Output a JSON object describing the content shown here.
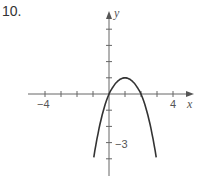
{
  "problem": {
    "number": "10."
  },
  "chart_data": {
    "type": "line",
    "title": "",
    "xlabel": "x",
    "ylabel": "y",
    "xlim": [
      -4.5,
      5.2
    ],
    "ylim": [
      -5,
      5
    ],
    "x_tick_labels": [
      {
        "value": -4,
        "label": "−4"
      },
      {
        "value": 4,
        "label": "4"
      }
    ],
    "y_tick_labels": [
      {
        "value": -3,
        "label": "−3"
      }
    ],
    "x_ticks": [
      -4,
      -3,
      -2,
      -1,
      1,
      2,
      3,
      4
    ],
    "y_ticks": [
      -4,
      -3,
      -2,
      -1,
      1,
      2,
      3,
      4
    ],
    "grid": false,
    "series": [
      {
        "name": "parabola",
        "description": "downward-opening parabola, vertex (1, 1), x-intercepts 0 and 2",
        "x": [
          -0.95,
          -0.5,
          0,
          0.5,
          1,
          1.5,
          2,
          2.5,
          2.95
        ],
        "y": [
          -3.9,
          -1.5,
          0,
          0.8,
          1,
          0.8,
          0,
          -1.5,
          -3.9
        ]
      }
    ],
    "color": "#333333"
  }
}
